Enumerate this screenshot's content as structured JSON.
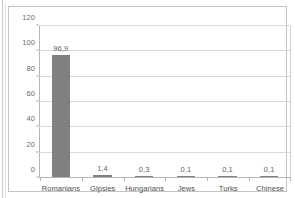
{
  "chart_data": {
    "type": "bar",
    "title": "",
    "subtitle": "",
    "xlabel": "",
    "ylabel": "",
    "categories": [
      "Romanians",
      "Gipsies",
      "Hungarians",
      "Jews",
      "Turks",
      "Chinese"
    ],
    "values": [
      96.9,
      1.4,
      0.3,
      0.1,
      0.1,
      0.1
    ],
    "value_labels": [
      "96,9",
      "1,4",
      "0,3",
      "0,1",
      "0,1",
      "0,1"
    ],
    "ylim": [
      0,
      120
    ],
    "ytick_values": [
      0,
      20,
      40,
      60,
      80,
      100,
      120
    ],
    "ytick_labels": [
      "0",
      "20",
      "40",
      "60",
      "80",
      "100",
      "120"
    ],
    "grid": true,
    "legend": "none",
    "bar_color": "#808080",
    "gridline_color": "#d9d9d9",
    "axis_color": "#b6b6b6",
    "frame_color": "#c4c4c4",
    "label_color": "#4f4f4f",
    "tick_label_color": "#6d6d6d"
  }
}
